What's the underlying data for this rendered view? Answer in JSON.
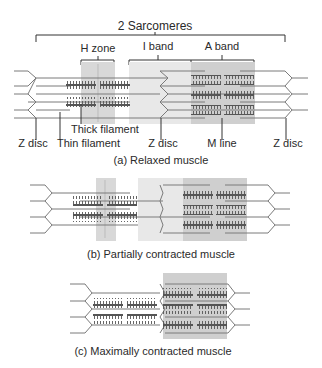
{
  "title": "2 Sarcomeres",
  "bands": {
    "h_zone": "H zone",
    "i_band": "I band",
    "a_band": "A band"
  },
  "labels": {
    "thick_filament": "Thick filament",
    "z_disc_left": "Z disc",
    "thin_filament": "Thin filament",
    "z_disc_middle": "Z disc",
    "m_line": "M line",
    "z_disc_right": "Z disc"
  },
  "panels": [
    {
      "caption": "(a) Relaxed muscle"
    },
    {
      "caption": "(b) Partially contracted muscle"
    },
    {
      "caption": "(c) Maximally contracted muscle"
    }
  ],
  "colors": {
    "filament": "#6b6b6b",
    "thick": "#555555",
    "band_light": "#e6e6e6",
    "band_dark": "#cfcfcf",
    "text": "#2a2a2a"
  }
}
